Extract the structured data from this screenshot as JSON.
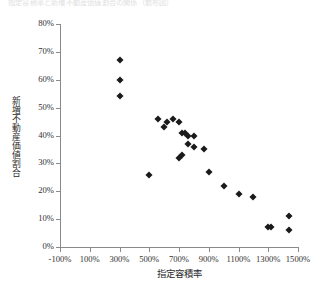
{
  "figure": {
    "top_note": "指定容積率と新増不動産価値割合の関係（散布図）"
  },
  "chart_data": {
    "type": "scatter",
    "title": "",
    "xlabel": "指定容積率",
    "ylabel": "新増不動産価値割合",
    "xlim": [
      -100,
      1500
    ],
    "ylim": [
      0,
      80
    ],
    "xtick_step": 200,
    "ytick_step": 10,
    "grid": false,
    "legend": null,
    "marker": "diamond",
    "marker_color": "#1a1a1a",
    "xticks": [
      "-100%",
      "100%",
      "300%",
      "500%",
      "700%",
      "900%",
      "1100%",
      "1300%",
      "1500%"
    ],
    "xtick_values": [
      -100,
      100,
      300,
      500,
      700,
      900,
      1100,
      1300,
      1500
    ],
    "yticks": [
      "0%",
      "10%",
      "20%",
      "30%",
      "40%",
      "50%",
      "60%",
      "70%",
      "80%"
    ],
    "ytick_values": [
      0,
      10,
      20,
      30,
      40,
      50,
      60,
      70,
      80
    ],
    "points": [
      {
        "x": 300,
        "y": 67
      },
      {
        "x": 300,
        "y": 60
      },
      {
        "x": 300,
        "y": 54
      },
      {
        "x": 500,
        "y": 26
      },
      {
        "x": 560,
        "y": 46
      },
      {
        "x": 600,
        "y": 43
      },
      {
        "x": 620,
        "y": 45
      },
      {
        "x": 660,
        "y": 46
      },
      {
        "x": 700,
        "y": 45
      },
      {
        "x": 720,
        "y": 41
      },
      {
        "x": 740,
        "y": 41
      },
      {
        "x": 760,
        "y": 40
      },
      {
        "x": 760,
        "y": 37
      },
      {
        "x": 720,
        "y": 33
      },
      {
        "x": 700,
        "y": 32
      },
      {
        "x": 800,
        "y": 40
      },
      {
        "x": 800,
        "y": 36
      },
      {
        "x": 870,
        "y": 35
      },
      {
        "x": 900,
        "y": 27
      },
      {
        "x": 1000,
        "y": 22
      },
      {
        "x": 1100,
        "y": 19
      },
      {
        "x": 1200,
        "y": 18
      },
      {
        "x": 1300,
        "y": 7
      },
      {
        "x": 1320,
        "y": 7
      },
      {
        "x": 1440,
        "y": 11
      },
      {
        "x": 1440,
        "y": 6
      }
    ]
  }
}
